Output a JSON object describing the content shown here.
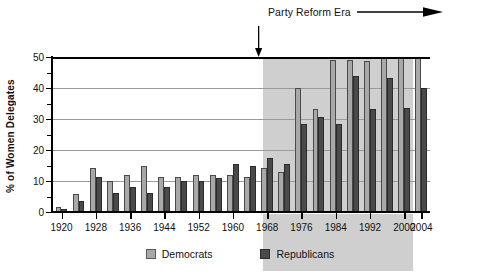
{
  "chart_data": {
    "type": "bar",
    "title": "",
    "xlabel": "",
    "ylabel": "% of Women Delegates",
    "ylim": [
      0,
      50
    ],
    "yticks": [
      0,
      10,
      20,
      30,
      40,
      50
    ],
    "yminor_ticks": [
      5,
      15,
      25,
      35,
      45
    ],
    "grid": "horizontal",
    "legend_position": "bottom-center",
    "categories": [
      "1920",
      "1924",
      "1928",
      "1932",
      "1936",
      "1940",
      "1944",
      "1948",
      "1952",
      "1956",
      "1960",
      "1964",
      "1968",
      "1972",
      "1976",
      "1980",
      "1984",
      "1988",
      "1992",
      "1996",
      "2000",
      "2004"
    ],
    "tick_labels": [
      "1920",
      "1928",
      "1936",
      "1944",
      "1952",
      "1960",
      "1968",
      "1976",
      "1984",
      "1992",
      "2000",
      "2004"
    ],
    "series": [
      {
        "name": "Democrats",
        "color": "#a8a8a8",
        "values": [
          1.5,
          5.8,
          14.2,
          10.0,
          12.1,
          14.8,
          11.4,
          11.2,
          12.1,
          12.0,
          12.0,
          11.2,
          14.2,
          13.0,
          40.0,
          33.3,
          49.0,
          49.0,
          48.7,
          57.0,
          55.0,
          56.0
        ]
      },
      {
        "name": "Republicans",
        "color": "#4a4a4a",
        "values": [
          1.0,
          3.5,
          11.2,
          6.1,
          8.0,
          6.2,
          8.0,
          10.0,
          10.0,
          11.0,
          15.4,
          14.8,
          17.3,
          15.5,
          28.3,
          30.8,
          28.5,
          44.0,
          33.3,
          43.2,
          33.4,
          39.9
        ]
      }
    ],
    "clipped_note": "Bars exceeding 50% are clipped at the top of the axis",
    "annotation": {
      "label": "Party Reform Era",
      "arrow": "right-arrow",
      "marker_year": 1968,
      "shaded_from": 1967,
      "shaded_to": 2000,
      "shade_color": "#cfcfcf"
    }
  },
  "legend": {
    "items": [
      {
        "label": "Democrats",
        "swatch": "democrats-swatch"
      },
      {
        "label": "Republicans",
        "swatch": "republicans-swatch"
      }
    ]
  }
}
